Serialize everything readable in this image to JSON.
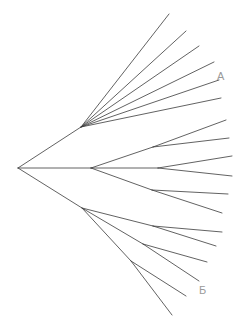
{
  "figure": {
    "type": "phylogenetic-tree",
    "orientation": "left-to-right",
    "background_color": "#ffffff",
    "line_color": "#3a3a3a",
    "label_color": "#9a9a9a",
    "width": 239,
    "height": 331
  },
  "labels": {
    "cluster_a": "A",
    "cluster_b": "Б"
  },
  "chart_data": {
    "type": "tree",
    "title": "",
    "xlabel": "",
    "ylabel": "",
    "root": {
      "id": "root",
      "x": 18,
      "y": 168
    },
    "internal_nodes": [
      {
        "id": "n-upper",
        "x": 81,
        "y": 127
      },
      {
        "id": "n-middle",
        "x": 91,
        "y": 168
      },
      {
        "id": "n-lower",
        "x": 82,
        "y": 208
      },
      {
        "id": "n-mid-up",
        "x": 153,
        "y": 147
      },
      {
        "id": "n-mid-ctr",
        "x": 158,
        "y": 168
      },
      {
        "id": "n-mid-dn",
        "x": 152,
        "y": 190
      },
      {
        "id": "n-low-a",
        "x": 153,
        "y": 226
      },
      {
        "id": "n-low-b",
        "x": 143,
        "y": 244
      },
      {
        "id": "n-low-c",
        "x": 131,
        "y": 261
      }
    ],
    "edges": [
      {
        "from": "root",
        "to": "n-upper",
        "x1": 18,
        "y1": 168,
        "x2": 81,
        "y2": 127
      },
      {
        "from": "root",
        "to": "n-middle",
        "x1": 18,
        "y1": 168,
        "x2": 91,
        "y2": 168
      },
      {
        "from": "root",
        "to": "n-lower",
        "x1": 18,
        "y1": 168,
        "x2": 82,
        "y2": 208
      },
      {
        "from": "n-upper",
        "to": "tipA1",
        "x1": 81,
        "y1": 127,
        "x2": 169,
        "y2": 14
      },
      {
        "from": "n-upper",
        "to": "tipA2",
        "x1": 81,
        "y1": 127,
        "x2": 186,
        "y2": 31
      },
      {
        "from": "n-upper",
        "to": "tipA3",
        "x1": 81,
        "y1": 127,
        "x2": 199,
        "y2": 46
      },
      {
        "from": "n-upper",
        "to": "tipA4",
        "x1": 81,
        "y1": 127,
        "x2": 214,
        "y2": 62
      },
      {
        "from": "n-upper",
        "to": "tipA5",
        "x1": 81,
        "y1": 127,
        "x2": 219,
        "y2": 80
      },
      {
        "from": "n-upper",
        "to": "tipA6",
        "x1": 81,
        "y1": 127,
        "x2": 221,
        "y2": 98
      },
      {
        "from": "n-middle",
        "to": "n-mid-up",
        "x1": 91,
        "y1": 168,
        "x2": 153,
        "y2": 147
      },
      {
        "from": "n-mid-up",
        "to": "tipM1",
        "x1": 153,
        "y1": 147,
        "x2": 226,
        "y2": 120
      },
      {
        "from": "n-mid-up",
        "to": "tipM2",
        "x1": 153,
        "y1": 147,
        "x2": 229,
        "y2": 138
      },
      {
        "from": "n-middle",
        "to": "n-mid-ctr",
        "x1": 91,
        "y1": 168,
        "x2": 158,
        "y2": 168
      },
      {
        "from": "n-mid-ctr",
        "to": "tipM3",
        "x1": 158,
        "y1": 168,
        "x2": 232,
        "y2": 156
      },
      {
        "from": "n-mid-ctr",
        "to": "tipM4",
        "x1": 158,
        "y1": 168,
        "x2": 232,
        "y2": 176
      },
      {
        "from": "n-middle",
        "to": "n-mid-dn",
        "x1": 91,
        "y1": 168,
        "x2": 152,
        "y2": 190
      },
      {
        "from": "n-mid-dn",
        "to": "tipM5",
        "x1": 152,
        "y1": 190,
        "x2": 228,
        "y2": 194
      },
      {
        "from": "n-mid-dn",
        "to": "tipM6",
        "x1": 152,
        "y1": 190,
        "x2": 222,
        "y2": 213
      },
      {
        "from": "n-lower",
        "to": "n-low-a",
        "x1": 82,
        "y1": 208,
        "x2": 153,
        "y2": 226
      },
      {
        "from": "n-low-a",
        "to": "tipB1",
        "x1": 153,
        "y1": 226,
        "x2": 222,
        "y2": 232
      },
      {
        "from": "n-low-a",
        "to": "tipB2",
        "x1": 153,
        "y1": 226,
        "x2": 216,
        "y2": 246
      },
      {
        "from": "n-lower",
        "to": "n-low-b",
        "x1": 82,
        "y1": 208,
        "x2": 143,
        "y2": 244
      },
      {
        "from": "n-low-b",
        "to": "tipB3",
        "x1": 143,
        "y1": 244,
        "x2": 207,
        "y2": 262
      },
      {
        "from": "n-low-b",
        "to": "tipB4",
        "x1": 143,
        "y1": 244,
        "x2": 199,
        "y2": 281
      },
      {
        "from": "n-lower",
        "to": "n-low-c",
        "x1": 82,
        "y1": 208,
        "x2": 131,
        "y2": 261
      },
      {
        "from": "n-low-c",
        "to": "tipB5",
        "x1": 131,
        "y1": 261,
        "x2": 186,
        "y2": 296
      },
      {
        "from": "n-low-c",
        "to": "tipB6",
        "x1": 131,
        "y1": 261,
        "x2": 172,
        "y2": 315
      }
    ],
    "annotations": [
      {
        "text": "A",
        "x": 219,
        "y": 78,
        "group": "upper-clade"
      },
      {
        "text": "Б",
        "x": 202,
        "y": 291,
        "group": "lower-clade"
      }
    ]
  }
}
